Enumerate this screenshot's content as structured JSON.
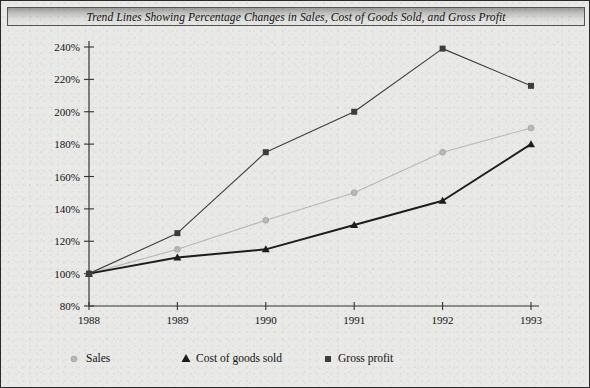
{
  "title": "Trend Lines Showing Percentage Changes in Sales, Cost of Goods Sold, and Gross Profit",
  "legend": {
    "sales_label": "Sales",
    "cogs_label": "Cost of goods sold",
    "gross_label": "Gross profit"
  },
  "axis": {
    "y_ticks": [
      "240%",
      "220%",
      "200%",
      "180%",
      "160%",
      "140%",
      "120%",
      "100%",
      "80%"
    ],
    "x_ticks": [
      "1988",
      "1989",
      "1990",
      "1991",
      "1992",
      "1993"
    ]
  },
  "colors": {
    "sales": "#b8b8b6",
    "cogs": "#1d1d1d",
    "gross": "#3d3d3d",
    "background": "#e9e9e7",
    "border": "#2a2a2a",
    "axis": "#333333"
  },
  "chart_data": {
    "type": "line",
    "title": "Trend Lines Showing Percentage Changes in Sales, Cost of Goods Sold, and Gross Profit",
    "xlabel": "",
    "ylabel": "",
    "x": [
      "1988",
      "1989",
      "1990",
      "1991",
      "1992",
      "1993"
    ],
    "ylim": [
      80,
      240
    ],
    "ytick_values": [
      240,
      220,
      200,
      180,
      160,
      140,
      120,
      100,
      80
    ],
    "ytick_labels": [
      "240%",
      "220%",
      "200%",
      "180%",
      "160%",
      "140%",
      "120%",
      "100%",
      "80%"
    ],
    "grid": false,
    "legend_position": "bottom",
    "series": [
      {
        "name": "Sales",
        "marker": "circle",
        "color": "#b8b8b6",
        "values": [
          100,
          115,
          133,
          150,
          175,
          190
        ]
      },
      {
        "name": "Cost of goods sold",
        "marker": "triangle",
        "color": "#1d1d1d",
        "values": [
          100,
          110,
          115,
          130,
          145,
          180
        ]
      },
      {
        "name": "Gross profit",
        "marker": "square",
        "color": "#3d3d3d",
        "values": [
          100,
          125,
          175,
          200,
          239,
          216
        ]
      }
    ]
  }
}
